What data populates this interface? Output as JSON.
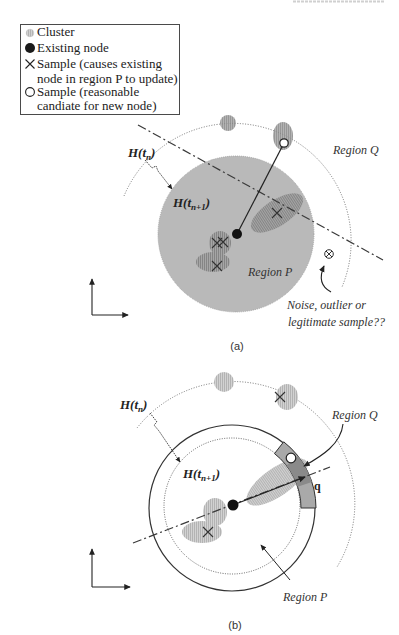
{
  "figure": {
    "legend": {
      "items": [
        {
          "icon": "cluster-icon",
          "lines": [
            "Cluster"
          ]
        },
        {
          "icon": "existing-node-icon",
          "lines": [
            "Existing node"
          ]
        },
        {
          "icon": "cross-icon",
          "lines": [
            "Sample (causes existing",
            "node in region P to update)"
          ]
        },
        {
          "icon": "open-circle-icon",
          "lines": [
            "Sample (reasonable",
            "candiate for new node)"
          ]
        }
      ]
    },
    "panel_a": {
      "caption": "(a)",
      "h_tn": {
        "base": "H(t",
        "sub": "n",
        "close": ")"
      },
      "h_tn1": {
        "base": "H(t",
        "sub": "n+1",
        "close": ")"
      },
      "region_q": "Region Q",
      "region_p": "Region P",
      "noise_note": [
        "Noise, outlier or",
        "legitimate sample??"
      ]
    },
    "panel_b": {
      "caption": "(b)",
      "h_tn": {
        "base": "H(t",
        "sub": "n",
        "close": ")"
      },
      "h_tn1": {
        "base": "H(t",
        "sub": "n+1",
        "close": ")"
      },
      "region_q": "Region Q",
      "region_p": "Region P",
      "q_label": "q"
    },
    "colors": {
      "region_p_fill": "#b9b9b9",
      "cluster_dark": "#8f8f8f",
      "cluster_light": "#c4c4c4",
      "band_fill": "#a9a9a9",
      "band_overlap": "#8a8a8a",
      "ink": "#222222"
    }
  }
}
